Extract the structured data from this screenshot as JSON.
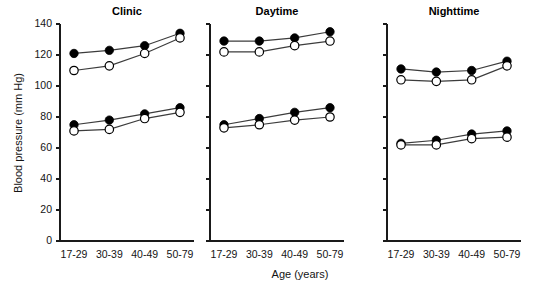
{
  "figure": {
    "width": 546,
    "height": 288,
    "background": "#ffffff",
    "ink_color": "#000000",
    "line_color": "#3c3c3c"
  },
  "axis": {
    "ylabel": "Blood pressure (mm Hg)",
    "xlabel": "Age (years)",
    "yticks": [
      0,
      20,
      40,
      60,
      80,
      100,
      120,
      140
    ],
    "ytick_labels": [
      "0",
      "20",
      "40",
      "60",
      "80",
      "100",
      "120",
      "140"
    ],
    "ylim": [
      0,
      140
    ],
    "xtick_labels": [
      "17-29",
      "30-39",
      "40-49",
      "50-79"
    ],
    "grid": false,
    "legend": "none"
  },
  "panels": [
    {
      "key": "clinic",
      "title": "Clinic"
    },
    {
      "key": "daytime",
      "title": "Daytime"
    },
    {
      "key": "nighttime",
      "title": "Nighttime"
    }
  ],
  "chart_data": {
    "type": "line",
    "title": "",
    "subtitle": "",
    "xlabel": "Age (years)",
    "ylabel": "Blood pressure (mm Hg)",
    "categories": [
      "17-29",
      "30-39",
      "40-49",
      "50-79"
    ],
    "ylim": [
      0,
      140
    ],
    "yticks": [
      0,
      20,
      40,
      60,
      80,
      100,
      120,
      140
    ],
    "grid": false,
    "legend_position": "none",
    "marker_styles": {
      "filled": "filled circle (closed marker)",
      "open": "open circle (white fill, black outline)"
    },
    "panels": [
      {
        "name": "Clinic",
        "series": [
          {
            "name": "Systolic - filled",
            "marker": "filled",
            "values": [
              121,
              123,
              126,
              134
            ]
          },
          {
            "name": "Systolic - open",
            "marker": "open",
            "values": [
              110,
              113,
              121,
              131
            ]
          },
          {
            "name": "Diastolic - filled",
            "marker": "filled",
            "values": [
              75,
              78,
              82,
              86
            ]
          },
          {
            "name": "Diastolic - open",
            "marker": "open",
            "values": [
              71,
              72,
              79,
              83
            ]
          }
        ]
      },
      {
        "name": "Daytime",
        "series": [
          {
            "name": "Systolic - filled",
            "marker": "filled",
            "values": [
              129,
              129,
              131,
              135
            ]
          },
          {
            "name": "Systolic - open",
            "marker": "open",
            "values": [
              122,
              122,
              126,
              129
            ]
          },
          {
            "name": "Diastolic - filled",
            "marker": "filled",
            "values": [
              75,
              79,
              83,
              86
            ]
          },
          {
            "name": "Diastolic - open",
            "marker": "open",
            "values": [
              73,
              75,
              78,
              80
            ]
          }
        ]
      },
      {
        "name": "Nighttime",
        "series": [
          {
            "name": "Systolic - filled",
            "marker": "filled",
            "values": [
              111,
              109,
              110,
              116
            ]
          },
          {
            "name": "Systolic - open",
            "marker": "open",
            "values": [
              104,
              103,
              104,
              113
            ]
          },
          {
            "name": "Diastolic - filled",
            "marker": "filled",
            "values": [
              63,
              65,
              69,
              71
            ]
          },
          {
            "name": "Diastolic - open",
            "marker": "open",
            "values": [
              62,
              62,
              66,
              67
            ]
          }
        ]
      }
    ]
  }
}
